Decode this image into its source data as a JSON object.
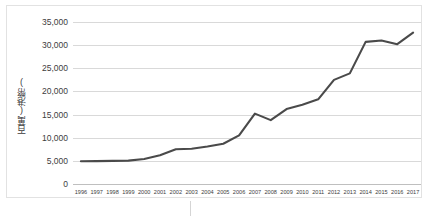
{
  "chart_data": {
    "type": "line",
    "title": "",
    "xlabel": "",
    "ylabel": "百萬(港幣)",
    "ylim": [
      0,
      35000
    ],
    "ytick_labels": [
      "35,000",
      "30,000",
      "25,000",
      "20,000",
      "15,000",
      "10,000",
      "5,000",
      "0"
    ],
    "ytick_values": [
      35000,
      30000,
      25000,
      20000,
      15000,
      10000,
      5000,
      0
    ],
    "grid": true,
    "legend": "none",
    "categories": [
      "1996",
      "1997",
      "1998",
      "1999",
      "2000",
      "2001",
      "2002",
      "2003",
      "2004",
      "2005",
      "2006",
      "2007",
      "2008",
      "2009",
      "2010",
      "2011",
      "2012",
      "2013",
      "2014",
      "2015",
      "2016",
      "2017"
    ],
    "series": [
      {
        "name": "百萬(港幣)",
        "color": "#4a4a4a",
        "values": [
          4900,
          4950,
          5000,
          5050,
          5400,
          6200,
          7500,
          7600,
          8100,
          8700,
          10500,
          15200,
          13800,
          16200,
          17100,
          18300,
          22500,
          23900,
          30700,
          31000,
          30200,
          32700
        ]
      }
    ]
  },
  "artifacts": {
    "caption_fragment": ""
  }
}
